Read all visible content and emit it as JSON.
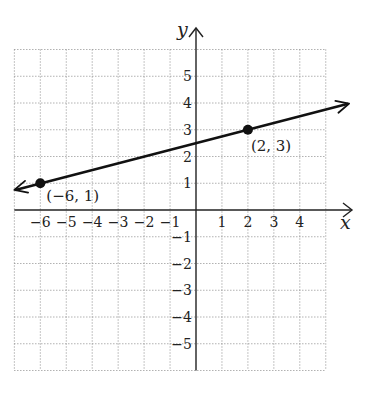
{
  "chart_data": {
    "type": "line",
    "title": "",
    "xlabel": "x",
    "ylabel": "y",
    "xlim": [
      -7,
      5
    ],
    "ylim": [
      -6,
      6
    ],
    "grid": true,
    "x_ticks": [
      -6,
      -5,
      -4,
      -3,
      -2,
      -1,
      1,
      2,
      3,
      4
    ],
    "y_ticks": [
      5,
      4,
      3,
      2,
      1,
      -1,
      -2,
      -3,
      -4,
      -5
    ],
    "x_tick_labels": [
      "−6",
      "−5",
      "−4",
      "−3",
      "−2",
      "−1",
      "1",
      "2",
      "3",
      "4"
    ],
    "y_tick_labels": [
      "5",
      "4",
      "3",
      "2",
      "1",
      "−1",
      "−2",
      "−3",
      "−4",
      "−5"
    ],
    "series": [
      {
        "name": "line through (−6, 1) and (2, 3)",
        "kind": "line-with-arrows-both-ends",
        "slope": 0.25,
        "intercept": 2.5,
        "x_range": [
          -7,
          5.9
        ],
        "points": [
          {
            "x": -6,
            "y": 1,
            "label": "(−6, 1)"
          },
          {
            "x": 2,
            "y": 3,
            "label": "(2, 3)"
          }
        ]
      }
    ]
  },
  "colors": {
    "line": "#111111",
    "axes": "#222222",
    "grid": "#8a8a8a",
    "background": "#ffffff"
  }
}
